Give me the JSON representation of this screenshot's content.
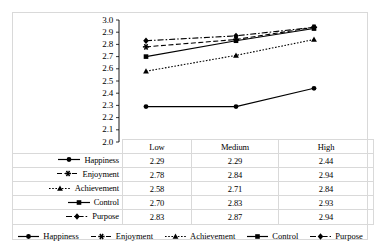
{
  "chart_data": {
    "type": "line",
    "title": "",
    "xlabel": "",
    "ylabel": "",
    "ylim": [
      2.0,
      3.0
    ],
    "ytick_step": 0.1,
    "grid": false,
    "legend_position": "bottom",
    "categories": [
      "Low",
      "Medium",
      "High"
    ],
    "yticks": [
      "3.0",
      "2.9",
      "2.8",
      "2.7",
      "2.6",
      "2.5",
      "2.4",
      "2.3",
      "2.2",
      "2.1",
      "2.0"
    ],
    "series": [
      {
        "name": "Happiness",
        "values": [
          2.29,
          2.29,
          2.44
        ],
        "labels": [
          "2.29",
          "2.29",
          "2.44"
        ],
        "line_style": "solid",
        "marker": "circle",
        "color": "#000000"
      },
      {
        "name": "Enjoyment",
        "values": [
          2.78,
          2.84,
          2.94
        ],
        "labels": [
          "2.78",
          "2.84",
          "2.94"
        ],
        "line_style": "dashed",
        "marker": "star",
        "color": "#000000"
      },
      {
        "name": "Achievement",
        "values": [
          2.58,
          2.71,
          2.84
        ],
        "labels": [
          "2.58",
          "2.71",
          "2.84"
        ],
        "line_style": "dotted",
        "marker": "triangle",
        "color": "#000000"
      },
      {
        "name": "Control",
        "values": [
          2.7,
          2.83,
          2.93
        ],
        "labels": [
          "2.70",
          "2.83",
          "2.93"
        ],
        "line_style": "solid",
        "marker": "square",
        "color": "#000000"
      },
      {
        "name": "Purpose",
        "values": [
          2.83,
          2.87,
          2.94
        ],
        "labels": [
          "2.83",
          "2.87",
          "2.94"
        ],
        "line_style": "dashdot",
        "marker": "diamond",
        "color": "#000000"
      }
    ]
  },
  "table": {
    "column_headers": [
      "Low",
      "Medium",
      "High"
    ],
    "rows": [
      {
        "label": "Happiness",
        "cells": [
          "2.29",
          "2.29",
          "2.44"
        ]
      },
      {
        "label": "Enjoyment",
        "cells": [
          "2.78",
          "2.84",
          "2.94"
        ]
      },
      {
        "label": "Achievement",
        "cells": [
          "2.58",
          "2.71",
          "2.84"
        ]
      },
      {
        "label": "Control",
        "cells": [
          "2.70",
          "2.83",
          "2.93"
        ]
      },
      {
        "label": "Purpose",
        "cells": [
          "2.83",
          "2.87",
          "2.94"
        ]
      }
    ]
  },
  "legend": {
    "items": [
      {
        "label": "Happiness"
      },
      {
        "label": "Enjoyment"
      },
      {
        "label": "Achievement"
      },
      {
        "label": "Control"
      },
      {
        "label": "Purpose"
      }
    ]
  },
  "colors": {
    "ink": "#000000",
    "grid": "#d9d9d9",
    "background": "#ffffff"
  }
}
